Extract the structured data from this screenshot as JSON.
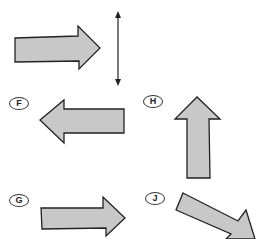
{
  "diagram": {
    "type": "arrow-direction-options",
    "colors": {
      "arrow_fill": "#c8c8c8",
      "arrow_stroke": "#222222",
      "line": "#222222"
    },
    "reference_arrow": {
      "direction": "right"
    },
    "mirror_line": {
      "orientation": "vertical",
      "ends": "arrowheads-both"
    },
    "options": [
      {
        "label": "F",
        "direction": "left"
      },
      {
        "label": "H",
        "direction": "up"
      },
      {
        "label": "G",
        "direction": "right"
      },
      {
        "label": "J",
        "direction": "down-right"
      }
    ]
  }
}
